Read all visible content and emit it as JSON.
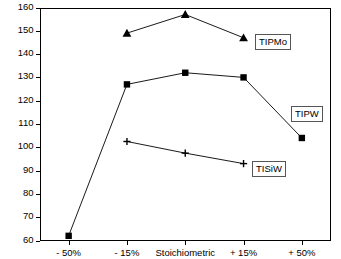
{
  "chart_data": {
    "type": "line",
    "title": "",
    "xlabel": "",
    "ylabel": "Surface Area (m2/g)",
    "categories": [
      "- 50%",
      "- 15%",
      "Stoichiometric",
      "+ 15%",
      "+ 50%"
    ],
    "ylim": [
      60,
      160
    ],
    "yticks": [
      60,
      70,
      80,
      90,
      100,
      110,
      120,
      130,
      140,
      150,
      160
    ],
    "ytick_labels": [
      "60",
      "70",
      "80",
      "90",
      "100",
      "110",
      "120",
      "130",
      "140",
      "150",
      "160"
    ],
    "grid": false,
    "legend_position": "inline-right-boxed",
    "series": [
      {
        "name": "TIPMo",
        "marker": "triangle",
        "color": "#000000",
        "x": [
          "- 15%",
          "Stoichiometric",
          "+ 15%"
        ],
        "values": [
          149,
          157,
          147
        ]
      },
      {
        "name": "TIPW",
        "marker": "square",
        "color": "#000000",
        "x": [
          "- 50%",
          "- 15%",
          "Stoichiometric",
          "+ 15%",
          "+ 50%"
        ],
        "values": [
          62,
          127,
          132,
          130,
          104
        ]
      },
      {
        "name": "TISiW",
        "marker": "plus",
        "color": "#000000",
        "x": [
          "- 15%",
          "Stoichiometric",
          "+ 15%"
        ],
        "values": [
          102.5,
          97.5,
          93
        ]
      }
    ],
    "annotations": [
      {
        "text": "TIPMo",
        "series": "TIPMo"
      },
      {
        "text": "TIPW",
        "series": "TIPW"
      },
      {
        "text": "TISiW",
        "series": "TISiW"
      }
    ]
  }
}
